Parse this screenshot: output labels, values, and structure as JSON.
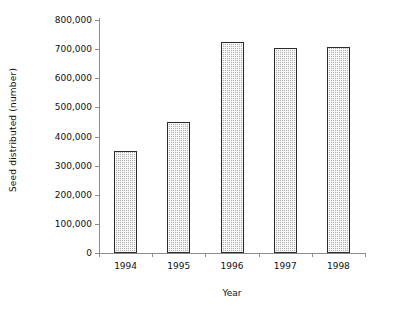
{
  "chart_data": {
    "type": "bar",
    "title": "",
    "xlabel": "Year",
    "ylabel": "Seed distributed (number)",
    "categories": [
      "1994",
      "1995",
      "1996",
      "1997",
      "1998"
    ],
    "values": [
      350000,
      450000,
      725000,
      705000,
      708000
    ],
    "series": [
      {
        "name": "Seed distributed",
        "values": [
          350000,
          450000,
          725000,
          705000,
          708000
        ]
      }
    ],
    "ylim": [
      0,
      800000
    ],
    "ytick_values": [
      0,
      100000,
      200000,
      300000,
      400000,
      500000,
      600000,
      700000,
      800000
    ],
    "ytick_labels": [
      "0",
      "100,000",
      "200,000",
      "300,000",
      "400,000",
      "500,000",
      "600,000",
      "700,000",
      "800,000"
    ],
    "grid": false,
    "legend": null,
    "legend_position": "none",
    "bar_fill_color": "#c9c9c9",
    "bar_border_color": "#2b2b2b",
    "axis_color": "#8c8c8c",
    "background_color": "#ffffff"
  }
}
